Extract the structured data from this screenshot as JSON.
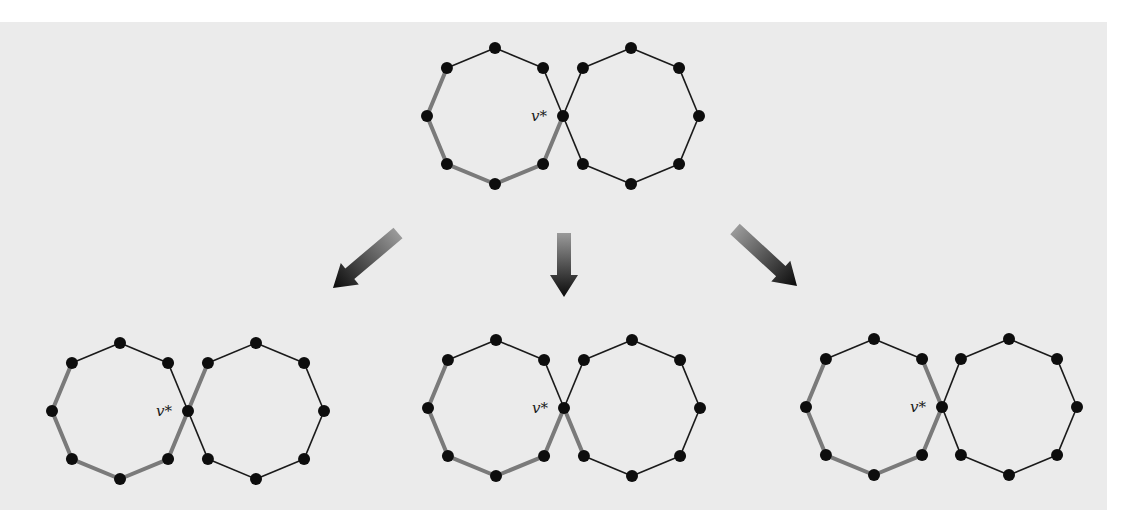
{
  "figure": {
    "background_color": "#ebebeb",
    "edge_color": "#1a1a1a",
    "highlight_color": "#7a7a7a",
    "node_color": "#0d0d0d",
    "vertex_label": "v*",
    "octagon_radius": 68,
    "node_radius": 6
  },
  "graphs": [
    {
      "id": "top",
      "left_center": [
        495,
        116
      ],
      "right_center": [
        631,
        116
      ],
      "highlight_path": [
        "L-upper-left",
        "L-left",
        "L-lower-left",
        "L-bottom",
        "L-lower-right",
        "v*"
      ],
      "extension": null
    },
    {
      "id": "bottom-left",
      "left_center": [
        120,
        411
      ],
      "right_center": [
        256,
        411
      ],
      "highlight_path": [
        "L-upper-left",
        "L-left",
        "L-lower-left",
        "L-bottom",
        "L-lower-right",
        "v*",
        "R-upper-left"
      ],
      "extension": "R-upper-left"
    },
    {
      "id": "bottom-middle",
      "left_center": [
        496,
        408
      ],
      "right_center": [
        632,
        408
      ],
      "highlight_path": [
        "L-upper-left",
        "L-left",
        "L-lower-left",
        "L-bottom",
        "L-lower-right",
        "v*",
        "R-lower-left"
      ],
      "extension": "R-lower-left"
    },
    {
      "id": "bottom-right",
      "left_center": [
        874,
        407
      ],
      "right_center": [
        1009,
        407
      ],
      "highlight_path": [
        "L-upper-left",
        "L-left",
        "L-lower-left",
        "L-bottom",
        "L-lower-right",
        "v*",
        "L-upper-right"
      ],
      "extension": "L-upper-right"
    }
  ],
  "arrows": [
    {
      "id": "arrow-left",
      "direction": "down-left",
      "from": [
        398,
        233
      ],
      "to": [
        333,
        288
      ]
    },
    {
      "id": "arrow-middle",
      "direction": "down",
      "from": [
        564,
        233
      ],
      "to": [
        564,
        297
      ]
    },
    {
      "id": "arrow-right",
      "direction": "down-right",
      "from": [
        735,
        229
      ],
      "to": [
        797,
        286
      ]
    }
  ]
}
